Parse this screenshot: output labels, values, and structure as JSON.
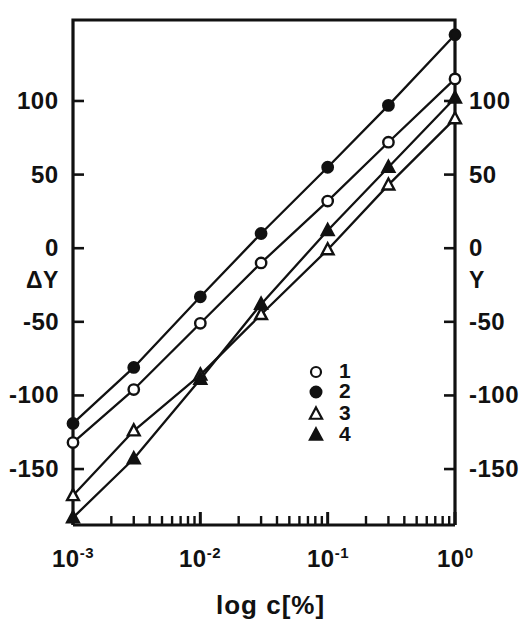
{
  "figure": {
    "background": "#ffffff",
    "ink": "#111111",
    "frame": {
      "left": 73,
      "right": 455,
      "top": 20,
      "bottom": 525
    }
  },
  "axes": {
    "left": {
      "name": "ΔY",
      "name_semantic": "delta-Y",
      "ticks": [
        {
          "value": 100,
          "label": "100"
        },
        {
          "value": 50,
          "label": "50"
        },
        {
          "value": 0,
          "label": "0"
        },
        {
          "value": -50,
          "label": "-50"
        },
        {
          "value": -100,
          "label": "-100"
        },
        {
          "value": -150,
          "label": "-150"
        }
      ]
    },
    "right": {
      "name": "Y",
      "ticks": [
        {
          "value": 100,
          "label": "100"
        },
        {
          "value": 50,
          "label": "50"
        },
        {
          "value": 0,
          "label": "0"
        },
        {
          "value": -50,
          "label": "-50"
        },
        {
          "value": -100,
          "label": "-100"
        },
        {
          "value": -150,
          "label": "-150"
        }
      ]
    },
    "bottom": {
      "label": "log c[%]",
      "ticks": [
        {
          "value": 0.001,
          "mantissa": "10",
          "exponent": "-3"
        },
        {
          "value": 0.01,
          "mantissa": "10",
          "exponent": "-2"
        },
        {
          "value": 0.1,
          "mantissa": "10",
          "exponent": "-1"
        },
        {
          "value": 1,
          "mantissa": "10",
          "exponent": "0"
        }
      ]
    }
  },
  "legend": {
    "entries": [
      {
        "label": "1",
        "marker": "open-circle"
      },
      {
        "label": "2",
        "marker": "filled-circle"
      },
      {
        "label": "3",
        "marker": "open-triangle"
      },
      {
        "label": "4",
        "marker": "filled-triangle"
      }
    ]
  },
  "chart_data": {
    "type": "line",
    "title": "",
    "xlabel": "log c[%]",
    "ylabel": "ΔY",
    "ylabel_right": "Y",
    "xscale": "log",
    "xlim": [
      0.001,
      1.0
    ],
    "ylim": [
      -188,
      155
    ],
    "grid": false,
    "legend_position": "center-right",
    "x": [
      0.001,
      0.003,
      0.01,
      0.03,
      0.1,
      0.3,
      1.0
    ],
    "series": [
      {
        "name": "1",
        "marker": "open-circle",
        "values": [
          -132,
          -96,
          -51,
          -10,
          32,
          72,
          115
        ]
      },
      {
        "name": "2",
        "marker": "filled-circle",
        "values": [
          -119,
          -81,
          -33,
          10,
          55,
          97,
          145
        ]
      },
      {
        "name": "3",
        "marker": "open-triangle",
        "values": [
          -168,
          -124,
          -86,
          -45,
          -1,
          43,
          88
        ]
      },
      {
        "name": "4",
        "marker": "filled-triangle",
        "values": [
          -183,
          -143,
          -89,
          -38,
          12,
          55,
          102
        ]
      }
    ]
  }
}
